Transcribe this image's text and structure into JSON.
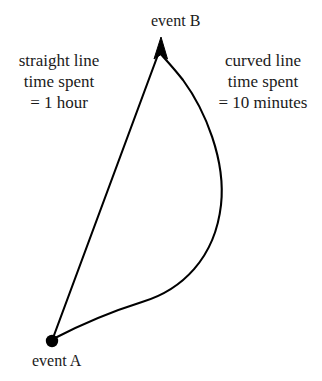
{
  "diagram": {
    "background_color": "#ffffff",
    "stroke_color": "#000000",
    "nodes": [
      {
        "id": "event_a",
        "label": "event A",
        "type": "filled-dot",
        "x": 52,
        "y": 341,
        "radius": 6
      },
      {
        "id": "event_b",
        "label": "event B",
        "type": "arrowhead",
        "x": 161,
        "y": 38
      }
    ],
    "paths": [
      {
        "id": "straight_line",
        "kind": "straight",
        "from": "event_a",
        "to": "event_b",
        "arrow": true
      },
      {
        "id": "curved_line",
        "kind": "curved",
        "from": "event_a",
        "to": "event_b",
        "arrow": true,
        "max_x": 222,
        "max_x_at_y": 200
      }
    ],
    "annotations": {
      "left": {
        "line1": "straight line",
        "line2": "time spent",
        "line3": "= 1 hour"
      },
      "right": {
        "line1": "curved line",
        "line2": "time spent",
        "line3": "= 10 minutes"
      }
    }
  }
}
